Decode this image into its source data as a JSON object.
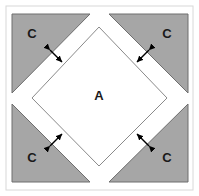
{
  "figure": {
    "canvas": {
      "width": 199,
      "height": 196
    },
    "colors": {
      "background": "#ffffff",
      "triangle_fill": "#a6a6a6",
      "triangle_stroke": "#6e6e6e",
      "diamond_fill": "#ffffff",
      "diamond_stroke": "#8a8a8a",
      "frame_stroke": "#d8d8d8",
      "arrow_color": "#000000",
      "label_color": "#1a1a1a"
    },
    "frame": {
      "x": 6,
      "y": 6,
      "width": 187,
      "height": 184
    },
    "center_region": {
      "label": "A",
      "label_x": 99,
      "label_y": 100,
      "vertices": "99,27 167,98 99,166 32,98"
    },
    "corner_regions": [
      {
        "name": "top-left",
        "label": "C",
        "label_x": 32,
        "label_y": 38,
        "points": "12,14 90,14 12,93"
      },
      {
        "name": "top-right",
        "label": "C",
        "label_x": 167,
        "label_y": 38,
        "points": "109,14 188,14 188,93"
      },
      {
        "name": "bottom-left",
        "label": "C",
        "label_x": 32,
        "label_y": 162,
        "points": "12,104 12,182 90,182"
      },
      {
        "name": "bottom-right",
        "label": "C",
        "label_x": 167,
        "label_y": 162,
        "points": "188,104 188,182 109,182"
      }
    ],
    "gap_arrows": [
      {
        "name": "arrow-top-left",
        "x1": 50,
        "y1": 50,
        "x2": 62,
        "y2": 62
      },
      {
        "name": "arrow-top-right",
        "x1": 149,
        "y1": 50,
        "x2": 137,
        "y2": 62
      },
      {
        "name": "arrow-bottom-left",
        "x1": 50,
        "y1": 146,
        "x2": 62,
        "y2": 134
      },
      {
        "name": "arrow-bottom-right",
        "x1": 149,
        "y1": 146,
        "x2": 137,
        "y2": 134
      }
    ]
  }
}
